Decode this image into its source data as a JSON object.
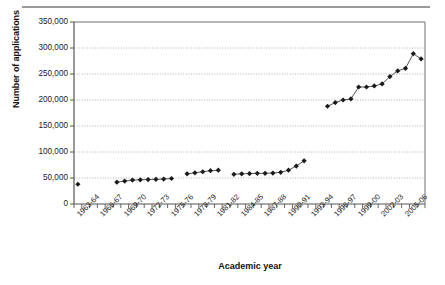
{
  "figure": {
    "name": "number-of-applications-by-academic-year",
    "has_top_rule": true
  },
  "axis_titles": {
    "y": "Number of applications",
    "x": "Academic year"
  },
  "chart_data": {
    "type": "scatter",
    "title": "",
    "subtitle": "",
    "xlabel": "Academic year",
    "ylabel": "Number of applications",
    "ylim": [
      0,
      350000
    ],
    "ytick_labels": [
      "0",
      "50,000",
      "100,000",
      "150,000",
      "200,000",
      "250,000",
      "300,000",
      "350,000"
    ],
    "ytick_values": [
      0,
      50000,
      100000,
      150000,
      200000,
      250000,
      300000,
      350000
    ],
    "grid": "horizontal-dotted",
    "legend": "none",
    "marker": "filled-diamond",
    "marker_color": "#1a1a1a",
    "line_color": "#555555",
    "xtick_labels": [
      "1963-64",
      "1966-67",
      "1969-70",
      "1972-73",
      "1975-76",
      "1978-79",
      "1981-82",
      "1984-85",
      "1987-88",
      "1990-91",
      "1993-94",
      "1996-97",
      "1999-00",
      "2002-03",
      "2005-06"
    ],
    "xtick_label_interval": 3,
    "categories": [
      "1963-64",
      "1964-65",
      "1965-66",
      "1966-67",
      "1967-68",
      "1968-69",
      "1969-70",
      "1970-71",
      "1971-72",
      "1972-73",
      "1973-74",
      "1974-75",
      "1975-76",
      "1976-77",
      "1977-78",
      "1978-79",
      "1979-80",
      "1980-81",
      "1981-82",
      "1982-83",
      "1983-84",
      "1984-85",
      "1985-86",
      "1986-87",
      "1987-88",
      "1988-89",
      "1989-90",
      "1990-91",
      "1991-92",
      "1992-93",
      "1993-94",
      "1994-95",
      "1995-96",
      "1996-97",
      "1997-98",
      "1998-99",
      "1999-00",
      "2000-01",
      "2001-02",
      "2002-03",
      "2003-04",
      "2004-05",
      "2005-06",
      "2006-07",
      "2007-08"
    ],
    "values": [
      38000,
      null,
      null,
      null,
      null,
      42000,
      44000,
      46000,
      46500,
      47000,
      47500,
      48000,
      49000,
      null,
      58000,
      60000,
      62000,
      64000,
      65000,
      null,
      57000,
      58000,
      58500,
      59000,
      59000,
      59500,
      61000,
      65000,
      73000,
      83000,
      null,
      null,
      188000,
      195000,
      200000,
      202000,
      225000,
      225000,
      227000,
      231000,
      245000,
      256000,
      261000,
      289000,
      279000
    ],
    "series_segments": [
      {
        "name": "segment-1",
        "start_index": 0,
        "end_index": 0,
        "connected": false
      },
      {
        "name": "segment-2",
        "start_index": 5,
        "end_index": 12,
        "connected": true
      },
      {
        "name": "segment-3",
        "start_index": 14,
        "end_index": 18,
        "connected": true
      },
      {
        "name": "segment-4",
        "start_index": 20,
        "end_index": 29,
        "connected": true
      },
      {
        "name": "segment-5",
        "start_index": 32,
        "end_index": 44,
        "connected": true
      }
    ]
  }
}
